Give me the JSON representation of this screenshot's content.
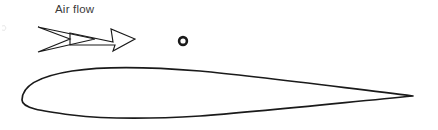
{
  "figure": {
    "background_color": "#ffffff",
    "ink_color": "#1a1a1a",
    "text_color": "#3a3a3a",
    "width": 438,
    "height": 130
  },
  "annotations": {
    "air_flow_label": {
      "text": "Air flow",
      "x": 55,
      "y": 13,
      "font_size": 11.5
    }
  },
  "arrow": {
    "name": "air-flow-arrow",
    "direction": "right",
    "style": "hollow double-chevron with barbed head",
    "x_start": 38,
    "x_end": 135,
    "y_center": 39,
    "stroke_width": 1.15
  },
  "marker": {
    "name": "reference-point-marker",
    "style": "hollow circle",
    "center_x": 183,
    "center_y": 41,
    "radius": 3.9,
    "stroke_width": 2.6
  },
  "airfoil": {
    "name": "airfoil-cross-section",
    "shape": "symmetric airfoil",
    "leading_edge_x": 22,
    "leading_edge_y": 100,
    "trailing_edge_x": 413,
    "trailing_edge_y": 96,
    "upper_peak_y": 68,
    "lower_peak_y": 117,
    "chord_length": 391,
    "max_thickness": 49,
    "stroke_width": 1.7
  }
}
